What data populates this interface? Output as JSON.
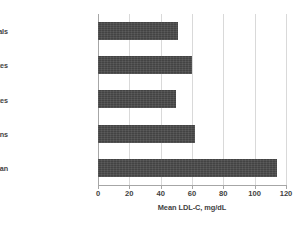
{
  "chart_data": {
    "type": "bar",
    "orientation": "horizontal",
    "title": "",
    "xlabel": "Mean LDL-C, mg/dL",
    "ylabel": "",
    "categories": [
      "Wild Mammals",
      "Wild Primates",
      "Neonates",
      "Hunter-Gatherer Humans",
      "Adult American"
    ],
    "values": [
      51,
      60,
      50,
      62,
      114
    ],
    "xlim": [
      0,
      120
    ],
    "xticks": [
      0,
      20,
      40,
      60,
      80,
      100,
      120
    ],
    "xtick_labels": [
      "0",
      "20",
      "40",
      "60",
      "80",
      "100",
      "120"
    ],
    "grid": "vertical",
    "legend": "none",
    "bar_color": "#4a4a4a",
    "gridline_color": "#d9d9d9",
    "axis_color": "#a6a6a6",
    "background_color": "#ffffff"
  }
}
